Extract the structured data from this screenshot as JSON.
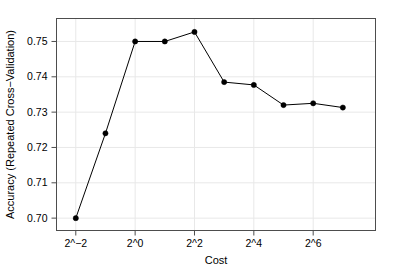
{
  "chart_data": {
    "type": "line",
    "title": "",
    "xlabel": "Cost",
    "ylabel": "Accuracy (Repeated Cross−Validation)",
    "x_tick_labels": [
      "2^−2",
      "2^0",
      "2^2",
      "2^4",
      "2^6"
    ],
    "x_tick_values": [
      -2,
      0,
      2,
      4,
      6
    ],
    "y_tick_labels": [
      "0.70",
      "0.71",
      "0.72",
      "0.73",
      "0.74",
      "0.75"
    ],
    "y_tick_values": [
      0.7,
      0.71,
      0.72,
      0.73,
      0.74,
      0.75
    ],
    "xlim": [
      -2.65,
      8.1
    ],
    "ylim": [
      0.6965,
      0.7565
    ],
    "grid": true,
    "legend": "none",
    "marker": "filled-circle",
    "series": [
      {
        "name": "Accuracy",
        "x": [
          -2,
          -1,
          0,
          1,
          2,
          3,
          4,
          5,
          6,
          7
        ],
        "x_labels": [
          "2^−2",
          "2^−1",
          "2^0",
          "2^1",
          "2^2",
          "2^3",
          "2^4",
          "2^5",
          "2^6",
          "2^7"
        ],
        "values": [
          0.7,
          0.724,
          0.75,
          0.75,
          0.7527,
          0.7385,
          0.7377,
          0.732,
          0.7325,
          0.7313
        ]
      }
    ]
  },
  "axes": {
    "x_title": "Cost",
    "y_title": "Accuracy (Repeated Cross−Validation)"
  },
  "colors": {
    "line": "#000000",
    "marker": "#000000",
    "grid": "#e8e8e8",
    "frame": "#4d4d4d",
    "background": "#ffffff"
  }
}
